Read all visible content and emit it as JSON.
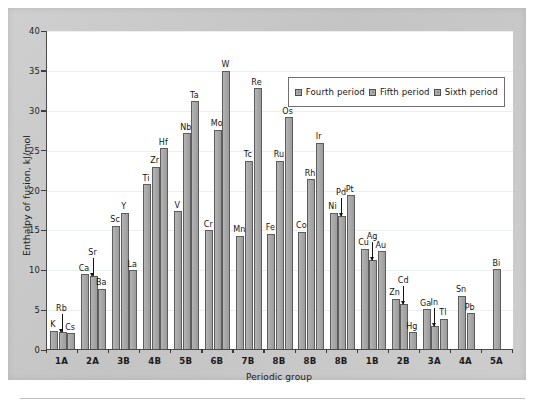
{
  "chart_data": {
    "type": "bar",
    "title": "",
    "xlabel": "Periodic group",
    "ylabel": "Enthalpy of fusion, kJ/mol",
    "ylim": [
      0,
      40
    ],
    "yticks": [
      0,
      5,
      10,
      15,
      20,
      25,
      30,
      35,
      40
    ],
    "grid": true,
    "legend_position": "top-right",
    "categories": [
      "1A",
      "2A",
      "3B",
      "4B",
      "5B",
      "6B",
      "7B",
      "8B",
      "8B",
      "8B",
      "1B",
      "2B",
      "3A",
      "4A",
      "5A"
    ],
    "series": [
      {
        "name": "Fourth period",
        "elements": [
          "K",
          "Ca",
          "Sc",
          "Ti",
          "V",
          "Cr",
          "Mn",
          "Fe",
          "Co",
          "Ni",
          "Cu",
          "Zn",
          "Ga",
          "Sn",
          "Bi"
        ],
        "values": [
          2.4,
          9.5,
          15.6,
          20.8,
          17.4,
          15.0,
          14.3,
          14.6,
          14.8,
          17.2,
          12.7,
          6.4,
          5.1,
          6.8,
          10.1
        ]
      },
      {
        "name": "Fifth period",
        "elements": [
          "Rb",
          "Sr",
          "Y",
          "Zr",
          "Nb",
          "Mo",
          "Tc",
          "Ru",
          "Rh",
          "Pd",
          "Ag",
          "Cd",
          "In",
          "Pb",
          ""
        ],
        "values": [
          2.3,
          9.3,
          17.2,
          23.0,
          27.2,
          27.6,
          23.7,
          23.7,
          21.4,
          16.8,
          11.3,
          5.8,
          3.0,
          4.6,
          null
        ]
      },
      {
        "name": "Sixth period",
        "elements": [
          "Cs",
          "Ba",
          "La",
          "Hf",
          "Ta",
          "W",
          "Re",
          "Os",
          "Ir",
          "Pt",
          "Au",
          "Hg",
          "Tl",
          "",
          ""
        ],
        "values": [
          2.1,
          7.7,
          10.0,
          25.3,
          31.2,
          35.0,
          32.8,
          29.2,
          26.0,
          19.4,
          12.4,
          2.2,
          3.9,
          null,
          null
        ]
      }
    ],
    "bars": [
      {
        "group": "1A",
        "element": "K",
        "value": 2.4,
        "series": "Fourth period",
        "label_arrow": false
      },
      {
        "group": "1A",
        "element": "Rb",
        "value": 2.3,
        "series": "Fifth period",
        "label_arrow": true
      },
      {
        "group": "1A",
        "element": "Cs",
        "value": 2.1,
        "series": "Sixth period",
        "label_arrow": false
      },
      {
        "group": "2A",
        "element": "Ca",
        "value": 9.5,
        "series": "Fourth period",
        "label_arrow": false
      },
      {
        "group": "2A",
        "element": "Sr",
        "value": 9.3,
        "series": "Fifth period",
        "label_arrow": true
      },
      {
        "group": "2A",
        "element": "Ba",
        "value": 7.7,
        "series": "Sixth period",
        "label_arrow": false
      },
      {
        "group": "3B",
        "element": "Sc",
        "value": 15.6,
        "series": "Fourth period",
        "label_arrow": false
      },
      {
        "group": "3B",
        "element": "Y",
        "value": 17.2,
        "series": "Fifth period",
        "label_arrow": false
      },
      {
        "group": "3B",
        "element": "La",
        "value": 10.0,
        "series": "Sixth period",
        "label_arrow": false
      },
      {
        "group": "4B",
        "element": "Ti",
        "value": 20.8,
        "series": "Fourth period",
        "label_arrow": false
      },
      {
        "group": "4B",
        "element": "Zr",
        "value": 23.0,
        "series": "Fifth period",
        "label_arrow": false
      },
      {
        "group": "4B",
        "element": "Hf",
        "value": 25.3,
        "series": "Sixth period",
        "label_arrow": false
      },
      {
        "group": "5B",
        "element": "V",
        "value": 17.4,
        "series": "Fourth period",
        "label_arrow": false
      },
      {
        "group": "5B",
        "element": "Nb",
        "value": 27.2,
        "series": "Fifth period",
        "label_arrow": false
      },
      {
        "group": "5B",
        "element": "Ta",
        "value": 31.2,
        "series": "Sixth period",
        "label_arrow": false
      },
      {
        "group": "6B",
        "element": "Cr",
        "value": 15.0,
        "series": "Fourth period",
        "label_arrow": false
      },
      {
        "group": "6B",
        "element": "Mo",
        "value": 27.6,
        "series": "Fifth period",
        "label_arrow": false
      },
      {
        "group": "6B",
        "element": "W",
        "value": 35.0,
        "series": "Sixth period",
        "label_arrow": false
      },
      {
        "group": "7B",
        "element": "Mn",
        "value": 14.3,
        "series": "Fourth period",
        "label_arrow": false
      },
      {
        "group": "7B",
        "element": "Tc",
        "value": 23.7,
        "series": "Fifth period",
        "label_arrow": false
      },
      {
        "group": "7B",
        "element": "Re",
        "value": 32.8,
        "series": "Sixth period",
        "label_arrow": false
      },
      {
        "group": "8B",
        "element": "Fe",
        "value": 14.6,
        "series": "Fourth period",
        "label_arrow": false
      },
      {
        "group": "8B",
        "element": "Ru",
        "value": 23.7,
        "series": "Fifth period",
        "label_arrow": false
      },
      {
        "group": "8B",
        "element": "Os",
        "value": 29.2,
        "series": "Sixth period",
        "label_arrow": false
      },
      {
        "group": "8B",
        "element": "Co",
        "value": 14.8,
        "series": "Fourth period",
        "label_arrow": false
      },
      {
        "group": "8B",
        "element": "Rh",
        "value": 21.4,
        "series": "Fifth period",
        "label_arrow": false
      },
      {
        "group": "8B",
        "element": "Ir",
        "value": 26.0,
        "series": "Sixth period",
        "label_arrow": false
      },
      {
        "group": "8B",
        "element": "Ni",
        "value": 17.2,
        "series": "Fourth period",
        "label_arrow": false
      },
      {
        "group": "8B",
        "element": "Pd",
        "value": 16.8,
        "series": "Fifth period",
        "label_arrow": true
      },
      {
        "group": "8B",
        "element": "Pt",
        "value": 19.4,
        "series": "Sixth period",
        "label_arrow": false
      },
      {
        "group": "1B",
        "element": "Cu",
        "value": 12.7,
        "series": "Fourth period",
        "label_arrow": false
      },
      {
        "group": "1B",
        "element": "Ag",
        "value": 11.3,
        "series": "Fifth period",
        "label_arrow": true
      },
      {
        "group": "1B",
        "element": "Au",
        "value": 12.4,
        "series": "Sixth period",
        "label_arrow": false
      },
      {
        "group": "2B",
        "element": "Zn",
        "value": 6.4,
        "series": "Fourth period",
        "label_arrow": false
      },
      {
        "group": "2B",
        "element": "Cd",
        "value": 5.8,
        "series": "Fifth period",
        "label_arrow": true
      },
      {
        "group": "2B",
        "element": "Hg",
        "value": 2.2,
        "series": "Sixth period",
        "label_arrow": false
      },
      {
        "group": "3A",
        "element": "Ga",
        "value": 5.1,
        "series": "Fourth period",
        "label_arrow": false
      },
      {
        "group": "3A",
        "element": "In",
        "value": 3.0,
        "series": "Fifth period",
        "label_arrow": true
      },
      {
        "group": "3A",
        "element": "Tl",
        "value": 3.9,
        "series": "Sixth period",
        "label_arrow": false
      },
      {
        "group": "4A",
        "element": "Sn",
        "value": 6.8,
        "series": "Fourth period",
        "label_arrow": false
      },
      {
        "group": "4A",
        "element": "Pb",
        "value": 4.6,
        "series": "Fifth period",
        "label_arrow": false
      },
      {
        "group": "5A",
        "element": "Bi",
        "value": 10.1,
        "series": "Fourth period",
        "label_arrow": false
      }
    ]
  },
  "axes": {
    "y_title": "Enthalpy of fusion, kJ/mol",
    "x_title": "Periodic group",
    "y_tick_labels": [
      "40",
      "35",
      "30",
      "25",
      "20",
      "15",
      "10",
      "5",
      "0"
    ],
    "x_tick_labels": [
      "1A",
      "2A",
      "3B",
      "4B",
      "5B",
      "6B",
      "7B",
      "8B",
      "8B",
      "8B",
      "1B",
      "2B",
      "3A",
      "4A",
      "5A"
    ]
  },
  "legend": {
    "items": [
      {
        "label": "Fourth period",
        "color": "#ababab"
      },
      {
        "label": "Fifth period",
        "color": "#ababab"
      },
      {
        "label": "Sixth period",
        "color": "#ababab"
      }
    ]
  },
  "colors": {
    "bar_fill": "#a8a8a8",
    "bar_stroke": "#5d5d5d",
    "plot_bg": "#ffffff",
    "mount_bg": "#c9c9c9",
    "axis": "#4a4a4a",
    "grid": "#eceff1",
    "text": "#1b1b1b"
  }
}
